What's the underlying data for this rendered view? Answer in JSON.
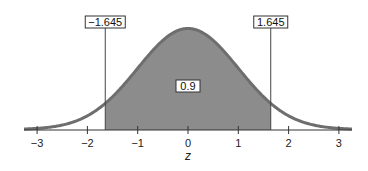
{
  "chart_data": {
    "type": "area",
    "title": "",
    "subtitle": "",
    "xlabel": "z",
    "ylabel": "",
    "xlim": [
      -3.3,
      3.3
    ],
    "x_ticks": [
      -3,
      -2,
      -1,
      0,
      1,
      2,
      3
    ],
    "x_tick_labels": [
      "−3",
      "−2",
      "−1",
      "0",
      "1",
      "2",
      "3"
    ],
    "grid": false,
    "legend": null,
    "distribution": "standard normal",
    "series": [
      {
        "name": "standard normal density",
        "mean": 0,
        "sd": 1,
        "shaded_region": {
          "from": -1.645,
          "to": 1.645,
          "area": 0.9
        }
      }
    ],
    "annotations": [
      {
        "text": "−1.645",
        "x": -1.645,
        "type": "vertical-line-label"
      },
      {
        "text": "1.645",
        "x": 1.645,
        "type": "vertical-line-label"
      },
      {
        "text": "0.9",
        "x": 0,
        "type": "area-label"
      }
    ],
    "colors": {
      "curve": "#6e6e6e",
      "fill": "#8c8c8c",
      "axis": "#333333",
      "lines": "#444444"
    }
  }
}
